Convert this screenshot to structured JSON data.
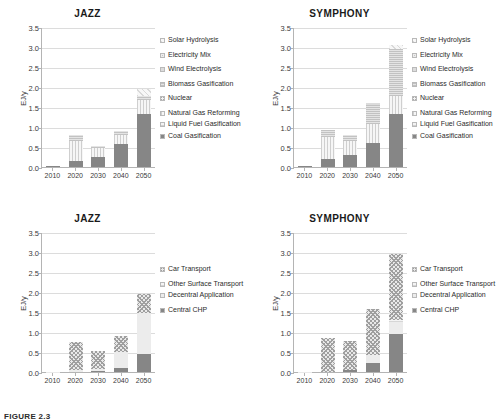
{
  "figure": {
    "caption": "FIGURE 2.3",
    "ylabel": "EJ/y",
    "categories": [
      "2010",
      "2020",
      "2030",
      "2040",
      "2050"
    ],
    "yticks": [
      "3.5",
      "3.0",
      "2.5",
      "2.0",
      "1.5",
      "1.0",
      "0.5",
      "0.0"
    ],
    "ylim": [
      0,
      3.5
    ]
  },
  "legend_supply": {
    "items": [
      {
        "label": "Solar Hydrolysis",
        "key": "solar"
      },
      {
        "label": "Electricity Mix",
        "key": "elecmix"
      },
      {
        "label": "Wind Electrolysis",
        "key": "wind"
      },
      {
        "label": "Biomass Gasification",
        "key": "biomass"
      },
      {
        "label": "Nuclear",
        "key": "nuclear"
      },
      {
        "label": "Natural Gas Reforming",
        "key": "natgas"
      },
      {
        "label": "Liquid Fuel Gasification",
        "key": "liquid"
      },
      {
        "label": "Coal Gasification",
        "key": "coal"
      }
    ]
  },
  "legend_demand": {
    "items": [
      {
        "label": "Car Transport",
        "key": "car"
      },
      {
        "label": "Other Surface Transport",
        "key": "othersurf"
      },
      {
        "label": "Decentral Application",
        "key": "decentral"
      },
      {
        "label": "Central CHP",
        "key": "central"
      }
    ]
  },
  "chart_data": [
    {
      "id": "jazz-supply",
      "type": "bar",
      "stacked": true,
      "title": "JAZZ",
      "xlabel": "",
      "ylabel": "EJ/y",
      "ylim": [
        0,
        3.5
      ],
      "grid": true,
      "legend_position": "right",
      "categories": [
        "2010",
        "2020",
        "2030",
        "2040",
        "2050"
      ],
      "series": [
        {
          "name": "Coal Gasification",
          "values": [
            0.02,
            0.14,
            0.24,
            0.58,
            1.33
          ]
        },
        {
          "name": "Liquid Fuel Gasification",
          "values": [
            0.0,
            0.0,
            0.0,
            0.0,
            0.0
          ]
        },
        {
          "name": "Natural Gas Reforming",
          "values": [
            0.0,
            0.52,
            0.23,
            0.23,
            0.35
          ]
        },
        {
          "name": "Nuclear",
          "values": [
            0.0,
            0.0,
            0.0,
            0.0,
            0.0
          ]
        },
        {
          "name": "Biomass Gasification",
          "values": [
            0.0,
            0.14,
            0.05,
            0.09,
            0.1
          ]
        },
        {
          "name": "Wind Electrolysis",
          "values": [
            0.0,
            0.0,
            0.0,
            0.0,
            0.0
          ]
        },
        {
          "name": "Electricity Mix",
          "values": [
            0.0,
            0.0,
            0.0,
            0.0,
            0.0
          ]
        },
        {
          "name": "Solar Hydrolysis",
          "values": [
            0.0,
            0.0,
            0.0,
            0.0,
            0.17
          ]
        }
      ],
      "totals": [
        0.02,
        0.8,
        0.52,
        0.9,
        1.95
      ]
    },
    {
      "id": "symphony-supply",
      "type": "bar",
      "stacked": true,
      "title": "SYMPHONY",
      "xlabel": "",
      "ylabel": "EJ/y",
      "ylim": [
        0,
        3.5
      ],
      "grid": true,
      "legend_position": "right",
      "categories": [
        "2010",
        "2020",
        "2030",
        "2040",
        "2050"
      ],
      "series": [
        {
          "name": "Coal Gasification",
          "values": [
            0.02,
            0.19,
            0.29,
            0.61,
            1.33
          ]
        },
        {
          "name": "Liquid Fuel Gasification",
          "values": [
            0.0,
            0.0,
            0.0,
            0.0,
            0.0
          ]
        },
        {
          "name": "Natural Gas Reforming",
          "values": [
            0.0,
            0.57,
            0.36,
            0.47,
            0.45
          ]
        },
        {
          "name": "Nuclear",
          "values": [
            0.0,
            0.0,
            0.0,
            0.0,
            0.0
          ]
        },
        {
          "name": "Biomass Gasification",
          "values": [
            0.0,
            0.17,
            0.14,
            0.46,
            1.18
          ]
        },
        {
          "name": "Wind Electrolysis",
          "values": [
            0.0,
            0.0,
            0.0,
            0.06,
            0.0
          ]
        },
        {
          "name": "Electricity Mix",
          "values": [
            0.0,
            0.0,
            0.0,
            0.0,
            0.0
          ]
        },
        {
          "name": "Solar Hydrolysis",
          "values": [
            0.0,
            0.0,
            0.0,
            0.0,
            0.09
          ]
        }
      ],
      "totals": [
        0.02,
        0.93,
        0.79,
        1.6,
        3.05
      ]
    },
    {
      "id": "jazz-demand",
      "type": "bar",
      "stacked": true,
      "title": "JAZZ",
      "xlabel": "",
      "ylabel": "EJ/y",
      "ylim": [
        0,
        3.5
      ],
      "grid": true,
      "legend_position": "right",
      "categories": [
        "2010",
        "2020",
        "2030",
        "2040",
        "2050"
      ],
      "series": [
        {
          "name": "Central CHP",
          "values": [
            0.0,
            0.0,
            0.02,
            0.09,
            0.45
          ]
        },
        {
          "name": "Decentral Application",
          "values": [
            0.0,
            0.06,
            0.06,
            0.42,
            1.02
          ]
        },
        {
          "name": "Other Surface Transport",
          "values": [
            0.0,
            0.0,
            0.0,
            0.0,
            0.0
          ]
        },
        {
          "name": "Car Transport",
          "values": [
            0.01,
            0.7,
            0.45,
            0.4,
            0.48
          ]
        }
      ],
      "totals": [
        0.01,
        0.76,
        0.53,
        0.91,
        1.95
      ]
    },
    {
      "id": "symphony-demand",
      "type": "bar",
      "stacked": true,
      "title": "SYMPHONY",
      "xlabel": "",
      "ylabel": "EJ/y",
      "ylim": [
        0,
        3.5
      ],
      "grid": true,
      "legend_position": "right",
      "categories": [
        "2010",
        "2020",
        "2030",
        "2040",
        "2050"
      ],
      "series": [
        {
          "name": "Central CHP",
          "values": [
            0.0,
            0.0,
            0.04,
            0.22,
            0.94
          ]
        },
        {
          "name": "Decentral Application",
          "values": [
            0.0,
            0.0,
            0.0,
            0.2,
            0.3
          ]
        },
        {
          "name": "Other Surface Transport",
          "values": [
            0.0,
            0.0,
            0.0,
            0.0,
            0.05
          ]
        },
        {
          "name": "Car Transport",
          "values": [
            0.01,
            0.86,
            0.74,
            1.16,
            1.66
          ]
        }
      ],
      "totals": [
        0.01,
        0.86,
        0.78,
        1.58,
        2.95
      ]
    }
  ]
}
